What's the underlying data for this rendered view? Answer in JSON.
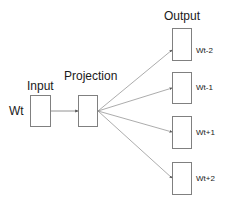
{
  "diagram": {
    "type": "skip-gram model architecture",
    "input_word": "Wt",
    "layers": {
      "input": "Input",
      "projection": "Projection",
      "output": "Output"
    },
    "outputs": [
      "Wt-2",
      "Wt-1",
      "Wt+1",
      "Wt+2"
    ],
    "colors": {
      "box_stroke": "#808080",
      "arrow": "#777777",
      "text": "#1a1a1a"
    }
  }
}
